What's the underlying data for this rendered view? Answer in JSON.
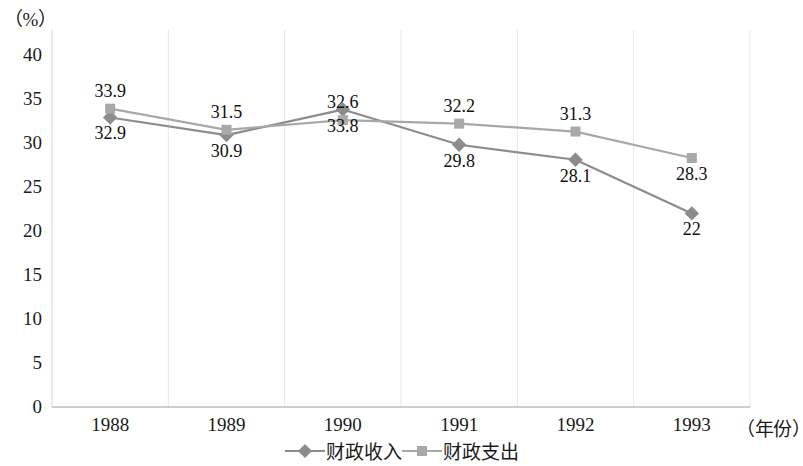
{
  "chart_data": {
    "type": "line",
    "title": "",
    "subtitle": "",
    "xlabel": "（年份）",
    "ylabel": "（%）",
    "categories": [
      "1988",
      "1989",
      "1990",
      "1991",
      "1992",
      "1993"
    ],
    "series": [
      {
        "name": "财政收入",
        "marker": "diamond",
        "color": "#8c8c8c",
        "values": [
          32.9,
          30.9,
          33.8,
          29.8,
          28.1,
          22
        ],
        "labels": [
          "32.9",
          "30.9",
          "33.8",
          "29.8",
          "28.1",
          "22"
        ],
        "label_positions": [
          "below",
          "below",
          "below",
          "below",
          "below",
          "below"
        ]
      },
      {
        "name": "财政支出",
        "marker": "square",
        "color": "#a8a8a8",
        "values": [
          33.9,
          31.5,
          32.6,
          32.2,
          31.3,
          28.3
        ],
        "labels": [
          "33.9",
          "31.5",
          "32.6",
          "32.2",
          "31.3",
          "28.3"
        ],
        "label_positions": [
          "above",
          "above",
          "above",
          "above",
          "above",
          "below"
        ]
      }
    ],
    "ylim": [
      0,
      40
    ],
    "ytick_step": 5,
    "yticks": [
      "40",
      "35",
      "30",
      "25",
      "20",
      "15",
      "10",
      "5",
      "0"
    ],
    "grid": "vertical-only",
    "legend_position": "bottom-center"
  },
  "legend": {
    "items": [
      {
        "label": "财政收入",
        "icon": "diamond-marker-icon"
      },
      {
        "label": "财政支出",
        "icon": "square-marker-icon"
      }
    ]
  }
}
